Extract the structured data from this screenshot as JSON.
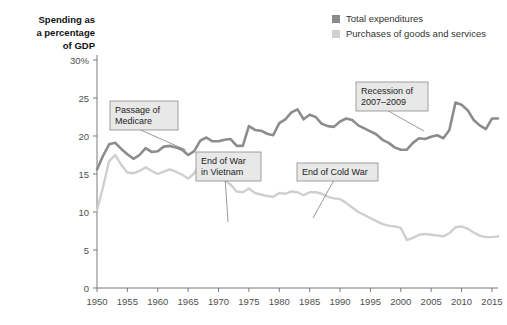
{
  "chart_data": {
    "type": "line",
    "title": "",
    "ylabel": "Spending as a percentage of GDP",
    "xlabel": "",
    "xlim": [
      1950,
      2016
    ],
    "ylim": [
      0,
      30
    ],
    "yticks": [
      0,
      5,
      10,
      15,
      20,
      25,
      30
    ],
    "ytick_labels": [
      "0",
      "5",
      "10",
      "15",
      "20",
      "25",
      "30%"
    ],
    "xticks": [
      1950,
      1955,
      1960,
      1965,
      1970,
      1975,
      1980,
      1985,
      1990,
      1995,
      2000,
      2005,
      2010,
      2015
    ],
    "xtick_labels": [
      "1950",
      "1955",
      "1960",
      "1965",
      "1970",
      "1975",
      "1980",
      "1985",
      "1990",
      "1995",
      "2000",
      "2005",
      "2010",
      "2015"
    ],
    "grid": false,
    "legend_position": "top-right",
    "colors": {
      "total_expenditures": "#8c8c8c",
      "purchases": "#cfcfcf",
      "axis": "#7a7a7a",
      "text": "#333333",
      "annotation_fill": "#e8e8e8",
      "annotation_stroke": "#8a8a8a"
    },
    "x": [
      1950,
      1951,
      1952,
      1953,
      1954,
      1955,
      1956,
      1957,
      1958,
      1959,
      1960,
      1961,
      1962,
      1963,
      1964,
      1965,
      1966,
      1967,
      1968,
      1969,
      1970,
      1971,
      1972,
      1973,
      1974,
      1975,
      1976,
      1977,
      1978,
      1979,
      1980,
      1981,
      1982,
      1983,
      1984,
      1985,
      1986,
      1987,
      1988,
      1989,
      1990,
      1991,
      1992,
      1993,
      1994,
      1995,
      1996,
      1997,
      1998,
      1999,
      2000,
      2001,
      2002,
      2003,
      2004,
      2005,
      2006,
      2007,
      2008,
      2009,
      2010,
      2011,
      2012,
      2013,
      2014,
      2015,
      2016
    ],
    "series": [
      {
        "name": "Total expenditures",
        "color": "#8c8c8c",
        "values": [
          15.6,
          17.4,
          18.9,
          19.1,
          18.3,
          17.6,
          17.0,
          17.5,
          18.4,
          17.9,
          18.0,
          18.6,
          18.7,
          18.5,
          18.2,
          17.5,
          18.0,
          19.4,
          19.8,
          19.3,
          19.3,
          19.5,
          19.6,
          18.7,
          18.7,
          21.3,
          20.8,
          20.7,
          20.3,
          20.1,
          21.7,
          22.2,
          23.1,
          23.5,
          22.2,
          22.8,
          22.5,
          21.6,
          21.3,
          21.2,
          21.9,
          22.3,
          22.1,
          21.4,
          21.0,
          20.6,
          20.2,
          19.5,
          19.1,
          18.5,
          18.2,
          18.2,
          19.1,
          19.7,
          19.6,
          19.9,
          20.1,
          19.7,
          20.8,
          24.4,
          24.1,
          23.4,
          22.1,
          21.4,
          20.9,
          22.3,
          22.3
        ]
      },
      {
        "name": "Purchases of goods and services",
        "color": "#cfcfcf",
        "values": [
          10.2,
          13.3,
          16.7,
          17.5,
          16.2,
          15.2,
          15.1,
          15.4,
          15.9,
          15.4,
          15.0,
          15.3,
          15.6,
          15.3,
          14.9,
          14.4,
          15.1,
          16.2,
          16.2,
          15.4,
          14.8,
          14.2,
          13.6,
          12.7,
          12.6,
          13.1,
          12.5,
          12.3,
          12.1,
          12.0,
          12.5,
          12.4,
          12.7,
          12.6,
          12.2,
          12.6,
          12.6,
          12.4,
          12.0,
          11.8,
          11.7,
          11.2,
          10.6,
          10.0,
          9.6,
          9.2,
          8.8,
          8.4,
          8.2,
          8.1,
          7.9,
          6.3,
          6.6,
          7.0,
          7.1,
          7.0,
          6.9,
          6.8,
          7.2,
          8.0,
          8.1,
          7.8,
          7.3,
          6.9,
          6.7,
          6.7,
          6.8
        ]
      }
    ],
    "annotations": [
      {
        "id": "passage-of-medicare",
        "lines": [
          "Passage of",
          "Medicare"
        ],
        "box_x": 110,
        "box_y": 101,
        "box_w": 68,
        "box_h": 29,
        "point_x": 186,
        "point_y": 150
      },
      {
        "id": "end-of-war-in-vietnam",
        "lines": [
          "End of War",
          "in Vietnam"
        ],
        "box_x": 196,
        "box_y": 152,
        "box_w": 65,
        "box_h": 29,
        "point_x": 228,
        "point_y": 222
      },
      {
        "id": "end-of-cold-war",
        "lines": [
          "End of Cold War"
        ],
        "box_x": 297,
        "box_y": 163,
        "box_w": 81,
        "box_h": 18,
        "point_x": 313,
        "point_y": 218
      },
      {
        "id": "recession-of-2007-2009",
        "lines": [
          "Recession of",
          "2007–2009"
        ],
        "box_x": 356,
        "box_y": 82,
        "box_w": 72,
        "box_h": 29,
        "point_x": 424,
        "point_y": 131
      }
    ]
  },
  "legend": {
    "items": [
      {
        "label": "Total expenditures",
        "color": "#8c8c8c"
      },
      {
        "label": "Purchases of goods and services",
        "color": "#cfcfcf"
      }
    ]
  },
  "axis_title": {
    "line1": "Spending as",
    "line2": "a percentage",
    "line3": "of GDP"
  }
}
